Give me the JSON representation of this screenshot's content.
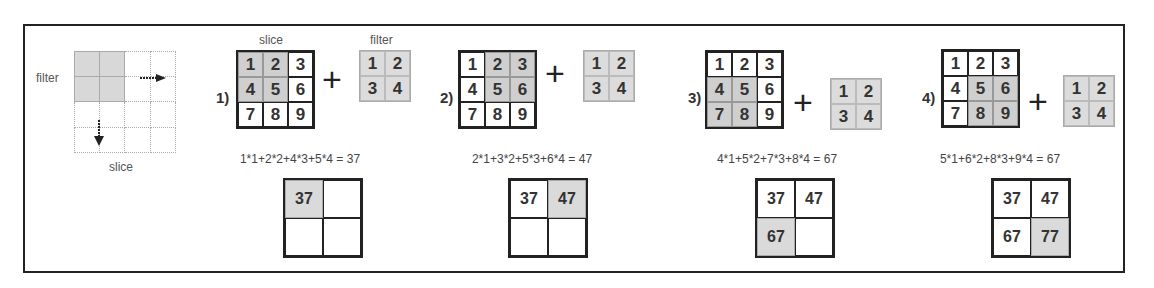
{
  "legend": {
    "filter_label": "filter",
    "slice_label": "slice",
    "icons": [
      "arrow-right-icon",
      "arrow-down-icon"
    ]
  },
  "labels": {
    "slice": "slice",
    "filter": "filter",
    "plus": "+"
  },
  "slice_values": [
    "1",
    "2",
    "3",
    "4",
    "5",
    "6",
    "7",
    "8",
    "9"
  ],
  "filter_values": [
    "1",
    "2",
    "3",
    "4"
  ],
  "steps": [
    {
      "num": "1)",
      "formula": "1*1+2*2+4*3+5*4 = 37",
      "shaded": [
        0,
        1,
        3,
        4
      ],
      "result": [
        "37",
        "",
        "",
        ""
      ],
      "result_shaded": 0
    },
    {
      "num": "2)",
      "formula": "2*1+3*2+5*3+6*4 = 47",
      "shaded": [
        1,
        2,
        4,
        5
      ],
      "result": [
        "37",
        "47",
        "",
        ""
      ],
      "result_shaded": 1
    },
    {
      "num": "3)",
      "formula": "4*1+5*2+7*3+8*4 = 67",
      "shaded": [
        3,
        4,
        6,
        7
      ],
      "result": [
        "37",
        "47",
        "67",
        ""
      ],
      "result_shaded": 2
    },
    {
      "num": "4)",
      "formula": "5*1+6*2+8*3+9*4 = 67",
      "shaded": [
        4,
        5,
        7,
        8
      ],
      "result": [
        "37",
        "47",
        "67",
        "77"
      ],
      "result_shaded": 3
    }
  ],
  "colors": {
    "shade": "#cfcfcf",
    "border": "#222222",
    "text": "#333333"
  }
}
